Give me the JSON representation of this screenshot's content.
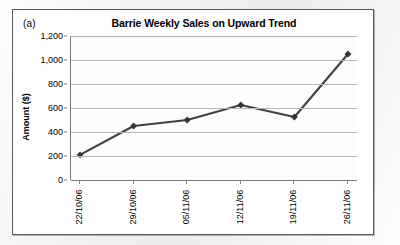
{
  "figure": {
    "panel_label": "(a)",
    "title": "Barrie Weekly Sales on Upward Trend"
  },
  "style": {
    "line_color": "#404040",
    "marker_color": "#333333",
    "gridline_color": "#b4b4b4",
    "axis_color": "#7a7a7a",
    "panel_border_color": "#595959",
    "plot_background": "#fdfdfd",
    "page_background": "#f2f2f2"
  },
  "chart_data": {
    "type": "line",
    "title": "Barrie Weekly Sales on Upward Trend",
    "xlabel": "",
    "ylabel": "Amount ($)",
    "categories": [
      "22/10/06",
      "29/10/06",
      "05/11/06",
      "12/11/06",
      "19/11/06",
      "26/11/06"
    ],
    "values": [
      210,
      450,
      500,
      625,
      525,
      1050
    ],
    "ylim": [
      0,
      1200
    ],
    "ytick_values": [
      0,
      200,
      400,
      600,
      800,
      1000,
      1200
    ],
    "ytick_labels": [
      "0",
      "200",
      "400",
      "600",
      "800",
      "1,000",
      "1,200"
    ],
    "grid": true,
    "legend": false,
    "marker": "diamond",
    "series": [
      {
        "name": "Weekly Sales",
        "values": [
          210,
          450,
          500,
          625,
          525,
          1050
        ]
      }
    ]
  }
}
